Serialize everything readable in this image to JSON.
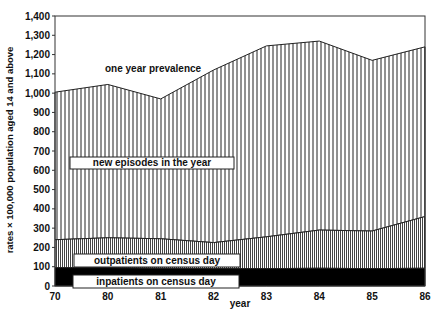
{
  "chart_data": {
    "type": "area",
    "stacked": true,
    "title": "",
    "xlabel": "year",
    "ylabel": "rates × 100,000 population aged 14 and above",
    "x_ticks": [
      "70",
      "80",
      "81",
      "82",
      "83",
      "84",
      "85",
      "86"
    ],
    "y_ticks": [
      "0",
      "100",
      "200",
      "300",
      "400",
      "500",
      "600",
      "700",
      "800",
      "900",
      "1,000",
      "1,100",
      "1,200",
      "1,300",
      "1,400"
    ],
    "ylim": [
      0,
      1400
    ],
    "grid": false,
    "x": [
      "70",
      "80",
      "81",
      "82",
      "83",
      "84",
      "85",
      "86"
    ],
    "series": [
      {
        "name": "inpatients on census day",
        "values": [
          95,
          95,
          92,
          90,
          90,
          92,
          90,
          92
        ],
        "cumulative_top": [
          95,
          95,
          92,
          90,
          90,
          92,
          90,
          92
        ]
      },
      {
        "name": "outpatients on census day",
        "values": [
          145,
          155,
          153,
          135,
          165,
          198,
          195,
          268
        ],
        "cumulative_top": [
          240,
          250,
          245,
          225,
          255,
          290,
          285,
          360
        ]
      },
      {
        "name": "new episodes in the year",
        "values": [
          765,
          795,
          725,
          895,
          990,
          980,
          885,
          880
        ],
        "cumulative_top": [
          1005,
          1045,
          970,
          1120,
          1245,
          1270,
          1170,
          1240
        ]
      }
    ],
    "total_label": "one year prevalence",
    "total": [
      1005,
      1045,
      970,
      1120,
      1245,
      1270,
      1170,
      1240
    ],
    "annotations": [
      "one year prevalence",
      "new episodes in the year",
      "outpatients on census day",
      "inpatients on census day"
    ]
  }
}
